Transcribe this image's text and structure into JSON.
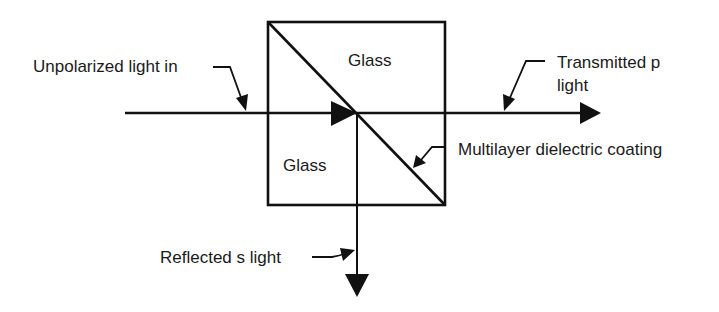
{
  "diagram": {
    "colors": {
      "stroke": "#111111",
      "text": "#1a1a1a",
      "background": "#ffffff"
    },
    "labels": {
      "input": "Unpolarized light in",
      "glass_top": "Glass",
      "glass_bottom": "Glass",
      "transmitted_line1": "Transmitted p",
      "transmitted_line2": "light",
      "coating": "Multilayer dielectric coating",
      "reflected": "Reflected s light"
    },
    "elements": [
      {
        "id": "cube",
        "type": "square",
        "description": "glass cube split by diagonal coating"
      },
      {
        "id": "incident-beam",
        "type": "arrow",
        "direction": "right"
      },
      {
        "id": "transmitted-beam",
        "type": "arrow",
        "direction": "right"
      },
      {
        "id": "reflected-beam",
        "type": "arrow",
        "direction": "down"
      }
    ]
  }
}
